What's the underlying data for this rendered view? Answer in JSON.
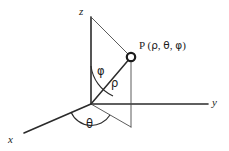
{
  "figure": {
    "type": "3d-coordinate-diagram",
    "background_color": "#ffffff",
    "line_color": "#2b2b2b",
    "thin_line_color": "#4a4a4a"
  },
  "axes": [
    {
      "id": "z",
      "label": "z",
      "label_x": 79,
      "label_y": 6,
      "direction": "up"
    },
    {
      "id": "y",
      "label": "y",
      "label_x": 212,
      "label_y": 97,
      "direction": "right"
    },
    {
      "id": "x",
      "label": "x",
      "label_x": 8,
      "label_y": 134,
      "direction": "lower-left"
    }
  ],
  "point": {
    "marker_label": "P",
    "label_prefix": "P (",
    "coord_rho": "ρ",
    "coord_theta": "θ",
    "coord_phi": "φ",
    "separator": ", ",
    "label_suffix": ")",
    "full_label": "P (ρ, θ, φ)",
    "label_x": 139,
    "label_y": 40,
    "marker_cx": 131,
    "marker_cy": 57,
    "marker_r": 4.2
  },
  "annotations": [
    {
      "id": "phi",
      "label": "φ",
      "x": 97,
      "y": 66,
      "meaning": "polar-angle-from-z-axis"
    },
    {
      "id": "rho",
      "label": "ρ",
      "x": 111,
      "y": 78,
      "meaning": "radial-distance"
    },
    {
      "id": "theta",
      "label": "θ",
      "x": 86,
      "y": 119,
      "meaning": "azimuthal-angle-in-xy-plane"
    }
  ],
  "geometry": {
    "origin": {
      "x": 91,
      "y": 104
    },
    "z_axis_top": {
      "x": 91,
      "y": 17
    },
    "y_axis_end": {
      "x": 208,
      "y": 104
    },
    "x_axis_end": {
      "x": 24,
      "y": 133
    },
    "foot_point": {
      "x": 131,
      "y": 127
    },
    "helper_lines": [
      {
        "from": {
          "x": 91,
          "y": 17
        },
        "to": {
          "x": 131,
          "y": 57
        }
      },
      {
        "from": {
          "x": 131,
          "y": 57
        },
        "to": {
          "x": 131,
          "y": 127
        }
      },
      {
        "from": {
          "x": 91,
          "y": 104
        },
        "to": {
          "x": 131,
          "y": 127
        }
      }
    ],
    "rho_segment": {
      "from": {
        "x": 91,
        "y": 104
      },
      "to": {
        "x": 131,
        "y": 57
      }
    }
  }
}
